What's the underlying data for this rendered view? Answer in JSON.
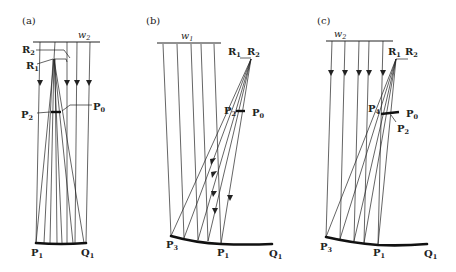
{
  "figure": {
    "panels": [
      {
        "id": "a",
        "label": "(a)",
        "wavefront": {
          "name": "w",
          "sub": "2"
        },
        "points": {
          "R2": {
            "name": "R",
            "sub": "2"
          },
          "R1": {
            "name": "R",
            "sub": "1"
          },
          "P2": {
            "name": "P",
            "sub": "2"
          },
          "P0": {
            "name": "P",
            "sub": "0"
          },
          "P1": {
            "name": "P",
            "sub": "1"
          },
          "Q1": {
            "name": "Q",
            "sub": "1"
          }
        }
      },
      {
        "id": "b",
        "label": "(b)",
        "wavefront": {
          "name": "w",
          "sub": "1"
        },
        "points": {
          "R1": {
            "name": "R",
            "sub": "1"
          },
          "R2": {
            "name": "R",
            "sub": "2"
          },
          "P2": {
            "name": "P",
            "sub": "2"
          },
          "P0": {
            "name": "P",
            "sub": "0"
          },
          "P3": {
            "name": "P",
            "sub": "3"
          },
          "P1": {
            "name": "P",
            "sub": "1"
          },
          "Q1": {
            "name": "Q",
            "sub": "1"
          }
        }
      },
      {
        "id": "c",
        "label": "(c)",
        "wavefront": {
          "name": "w",
          "sub": "2"
        },
        "points": {
          "R1": {
            "name": "R",
            "sub": "1"
          },
          "R2": {
            "name": "R",
            "sub": "2"
          },
          "P4": {
            "name": "P",
            "sub": "4"
          },
          "P0": {
            "name": "P",
            "sub": "0"
          },
          "P2": {
            "name": "P",
            "sub": "2"
          },
          "P3": {
            "name": "P",
            "sub": "3"
          },
          "P1": {
            "name": "P",
            "sub": "1"
          },
          "Q1": {
            "name": "Q",
            "sub": "1"
          }
        }
      }
    ]
  }
}
